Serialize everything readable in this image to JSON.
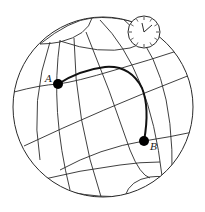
{
  "diagram": {
    "type": "globe-great-circle",
    "points": [
      {
        "id": "A",
        "label": "A"
      },
      {
        "id": "B",
        "label": "B"
      }
    ],
    "colors": {
      "line": "#2a2a2a",
      "path": "#111111",
      "point": "#000000",
      "background": "#ffffff"
    },
    "icons": {
      "clock": "clock-icon"
    }
  }
}
